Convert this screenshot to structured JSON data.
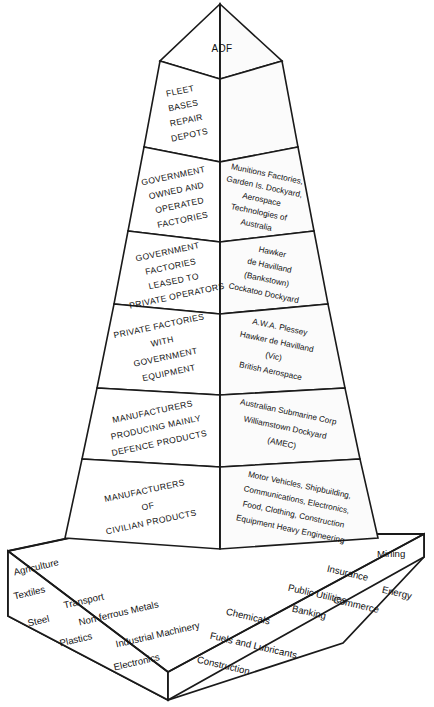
{
  "diagram": {
    "type": "pyramid-3d",
    "apex": {
      "label": "ADF"
    },
    "tiers": [
      {
        "id": "tier-1",
        "left_label_lines": [
          "FLEET",
          "BASES",
          "REPAIR",
          "DEPOTS"
        ],
        "right_label_lines": []
      },
      {
        "id": "tier-2",
        "left_label_lines": [
          "GOVERNMENT",
          "OWNED AND",
          "OPERATED",
          "FACTORIES"
        ],
        "right_label_lines": [
          "Munitions Factories,",
          "Garden Is. Dockyard,",
          "Aerospace",
          "Technologies of",
          "Australia"
        ]
      },
      {
        "id": "tier-3",
        "left_label_lines": [
          "GOVERNMENT",
          "FACTORIES",
          "LEASED TO",
          "PRIVATE OPERATORS"
        ],
        "right_label_lines": [
          "Hawker",
          "de Havilland",
          "(Bankstown)",
          "Cockatoo Dockyard"
        ]
      },
      {
        "id": "tier-4",
        "left_label_lines": [
          "PRIVATE FACTORIES",
          "WITH",
          "GOVERNMENT",
          "EQUIPMENT"
        ],
        "right_label_lines": [
          "A.W.A. Plessey",
          "Hawker de Havilland",
          "(Vic)",
          "British Aerospace"
        ]
      },
      {
        "id": "tier-5",
        "left_label_lines": [
          "MANUFACTURERS",
          "PRODUCING MAINLY",
          "DEFENCE PRODUCTS"
        ],
        "right_label_lines": [
          "Australian Submarine Corp",
          "Williamstown Dockyard",
          "(AMEC)"
        ]
      },
      {
        "id": "tier-6",
        "left_label_lines": [
          "MANUFACTURERS",
          "OF",
          "CIVILIAN PRODUCTS"
        ],
        "right_label_lines": [
          "Motor Vehicles, Shipbuilding,",
          "Communications, Electronics,",
          "Food, Clothing, Construction",
          "Equipment Heavy Engineering"
        ]
      }
    ],
    "base": {
      "left_face_sectors": [
        "Agriculture",
        "Textiles",
        "Transport",
        "Steel",
        "Non-ferrous Metals",
        "Plastics",
        "Industrial Machinery",
        "Electronics"
      ],
      "right_face_sectors": [
        "Mining",
        "Insurance",
        "Public Utilities",
        "Energy",
        "Chemicals",
        "Banking",
        "Commerce",
        "Fuels and Lubricants",
        "Construction"
      ]
    },
    "colors": {
      "stroke": "#1a1a1a",
      "fill": "#ffffff",
      "text": "#111111"
    }
  }
}
